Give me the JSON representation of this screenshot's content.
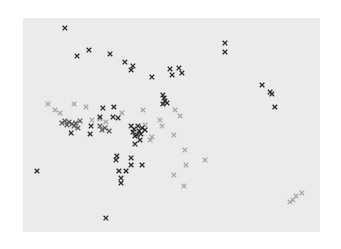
{
  "chart_data": {
    "type": "scatter",
    "title": "",
    "xlabel": "",
    "ylabel": "",
    "xlim": [
      0,
      1
    ],
    "ylim": [
      0,
      1
    ],
    "grid": false,
    "legend": "none",
    "background_color": "#ebebeb",
    "marker": "x",
    "series": [
      {
        "name": "dark",
        "color": "#2a2a2a",
        "points": [
          [
            0.141,
            0.953
          ],
          [
            0.222,
            0.85
          ],
          [
            0.182,
            0.822
          ],
          [
            0.293,
            0.832
          ],
          [
            0.343,
            0.794
          ],
          [
            0.37,
            0.776
          ],
          [
            0.364,
            0.757
          ],
          [
            0.434,
            0.724
          ],
          [
            0.495,
            0.762
          ],
          [
            0.525,
            0.766
          ],
          [
            0.502,
            0.734
          ],
          [
            0.535,
            0.743
          ],
          [
            0.68,
            0.883
          ],
          [
            0.68,
            0.841
          ],
          [
            0.805,
            0.687
          ],
          [
            0.832,
            0.654
          ],
          [
            0.838,
            0.645
          ],
          [
            0.848,
            0.584
          ],
          [
            0.471,
            0.64
          ],
          [
            0.475,
            0.626
          ],
          [
            0.478,
            0.612
          ],
          [
            0.471,
            0.598
          ],
          [
            0.485,
            0.603
          ],
          [
            0.269,
            0.579
          ],
          [
            0.306,
            0.584
          ],
          [
            0.259,
            0.537
          ],
          [
            0.303,
            0.537
          ],
          [
            0.32,
            0.533
          ],
          [
            0.229,
            0.495
          ],
          [
            0.162,
            0.463
          ],
          [
            0.226,
            0.458
          ],
          [
            0.37,
            0.467
          ],
          [
            0.384,
            0.453
          ],
          [
            0.374,
            0.481
          ],
          [
            0.391,
            0.472
          ],
          [
            0.397,
            0.458
          ],
          [
            0.377,
            0.449
          ],
          [
            0.387,
            0.495
          ],
          [
            0.401,
            0.486
          ],
          [
            0.364,
            0.495
          ],
          [
            0.411,
            0.477
          ],
          [
            0.377,
            0.411
          ],
          [
            0.394,
            0.43
          ],
          [
            0.316,
            0.355
          ],
          [
            0.313,
            0.336
          ],
          [
            0.364,
            0.346
          ],
          [
            0.323,
            0.285
          ],
          [
            0.347,
            0.285
          ],
          [
            0.33,
            0.252
          ],
          [
            0.33,
            0.229
          ],
          [
            0.401,
            0.313
          ],
          [
            0.364,
            0.313
          ],
          [
            0.047,
            0.285
          ],
          [
            0.279,
            0.065
          ]
        ]
      },
      {
        "name": "medium",
        "color": "#5a5a5a",
        "points": [
          [
            0.141,
            0.519
          ],
          [
            0.155,
            0.514
          ],
          [
            0.165,
            0.505
          ],
          [
            0.148,
            0.5
          ],
          [
            0.178,
            0.509
          ],
          [
            0.172,
            0.495
          ],
          [
            0.192,
            0.519
          ],
          [
            0.185,
            0.486
          ],
          [
            0.131,
            0.509
          ],
          [
            0.259,
            0.495
          ],
          [
            0.276,
            0.486
          ],
          [
            0.266,
            0.477
          ],
          [
            0.29,
            0.472
          ]
        ]
      },
      {
        "name": "light",
        "color": "#a8a8a8",
        "points": [
          [
            0.084,
            0.598
          ],
          [
            0.108,
            0.57
          ],
          [
            0.125,
            0.556
          ],
          [
            0.172,
            0.598
          ],
          [
            0.212,
            0.584
          ],
          [
            0.259,
            0.528
          ],
          [
            0.232,
            0.523
          ],
          [
            0.279,
            0.514
          ],
          [
            0.333,
            0.556
          ],
          [
            0.404,
            0.57
          ],
          [
            0.411,
            0.5
          ],
          [
            0.461,
            0.523
          ],
          [
            0.468,
            0.495
          ],
          [
            0.434,
            0.444
          ],
          [
            0.428,
            0.43
          ],
          [
            0.512,
            0.57
          ],
          [
            0.529,
            0.542
          ],
          [
            0.508,
            0.453
          ],
          [
            0.545,
            0.383
          ],
          [
            0.508,
            0.266
          ],
          [
            0.549,
            0.313
          ],
          [
            0.613,
            0.336
          ],
          [
            0.542,
            0.215
          ],
          [
            0.919,
            0.168
          ],
          [
            0.909,
            0.15
          ],
          [
            0.939,
            0.182
          ],
          [
            0.899,
            0.14
          ]
        ]
      }
    ]
  }
}
